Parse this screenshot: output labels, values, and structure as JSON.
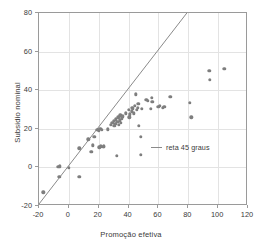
{
  "chart_data": {
    "type": "scatter",
    "title": "",
    "xlabel": "Promoção efetiva",
    "ylabel": "Subsídio nominal",
    "xlim": [
      -20,
      120
    ],
    "ylim": [
      -20,
      80
    ],
    "xticks": [
      -20,
      0,
      20,
      40,
      60,
      80,
      100,
      120
    ],
    "yticks": [
      -20,
      0,
      20,
      40,
      60,
      80
    ],
    "grid": true,
    "legend_position": "inside-right",
    "point_color": "#7e7e7e",
    "line_color": "#8a8a8a",
    "series": [
      {
        "name": "observações",
        "type": "scatter",
        "points": [
          [
            -17,
            -13
          ],
          [
            -7,
            0.3
          ],
          [
            -6.5,
            -5
          ],
          [
            -6,
            0.5
          ],
          [
            0,
            -0.2
          ],
          [
            7,
            -5
          ],
          [
            7,
            9.8
          ],
          [
            13,
            14.5
          ],
          [
            15,
            8
          ],
          [
            16,
            11.5
          ],
          [
            17,
            16
          ],
          [
            19,
            19.5
          ],
          [
            20,
            19.3
          ],
          [
            20.5,
            10.5
          ],
          [
            21,
            20
          ],
          [
            21.5,
            11
          ],
          [
            22,
            19.5
          ],
          [
            23,
            10.8
          ],
          [
            23.5,
            11
          ],
          [
            26,
            19.8
          ],
          [
            28,
            22
          ],
          [
            29,
            23
          ],
          [
            30,
            24
          ],
          [
            30.5,
            21.5
          ],
          [
            31,
            22.5
          ],
          [
            31.5,
            25
          ],
          [
            32,
            6
          ],
          [
            32.5,
            23.5
          ],
          [
            33,
            26
          ],
          [
            33.5,
            22
          ],
          [
            34,
            24.5
          ],
          [
            34.5,
            27
          ],
          [
            35,
            23
          ],
          [
            35.5,
            25.5
          ],
          [
            36,
            26.5
          ],
          [
            38,
            28
          ],
          [
            40,
            30
          ],
          [
            40.5,
            26
          ],
          [
            41,
            27.5
          ],
          [
            42,
            29
          ],
          [
            42.5,
            31
          ],
          [
            43,
            30.5
          ],
          [
            43.5,
            28
          ],
          [
            44,
            32
          ],
          [
            45,
            37.8
          ],
          [
            45.5,
            30
          ],
          [
            46,
            31
          ],
          [
            46.5,
            33
          ],
          [
            47,
            21.5
          ],
          [
            48,
            6.5
          ],
          [
            48,
            16
          ],
          [
            49,
            30.5
          ],
          [
            52,
            35
          ],
          [
            53,
            34.5
          ],
          [
            55,
            30.5
          ],
          [
            55.5,
            36
          ],
          [
            56,
            34
          ],
          [
            60,
            31.5
          ],
          [
            61,
            32
          ],
          [
            63,
            31
          ],
          [
            64,
            31.3
          ],
          [
            68,
            36.5
          ],
          [
            81,
            33.5
          ],
          [
            82,
            26
          ],
          [
            94,
            50
          ],
          [
            94.5,
            45.5
          ],
          [
            104,
            51
          ]
        ]
      },
      {
        "name": "reta 45 graus",
        "type": "line",
        "points": [
          [
            -20,
            -20
          ],
          [
            80,
            80
          ]
        ]
      }
    ],
    "legend": [
      {
        "label": "reta 45 graus",
        "marker": "line",
        "color": "#8a8a8a"
      }
    ]
  },
  "axes": {
    "x_title": "Promoção efetiva",
    "y_title": "Subsídio nominal",
    "x_tick_labels": [
      "-20",
      "0",
      "20",
      "40",
      "60",
      "80",
      "100",
      "120"
    ],
    "y_tick_labels": [
      "-20",
      "0",
      "20",
      "40",
      "60",
      "80"
    ]
  },
  "legend": {
    "entry_label": "reta 45 graus"
  },
  "caption": {
    "top_strip": ""
  }
}
